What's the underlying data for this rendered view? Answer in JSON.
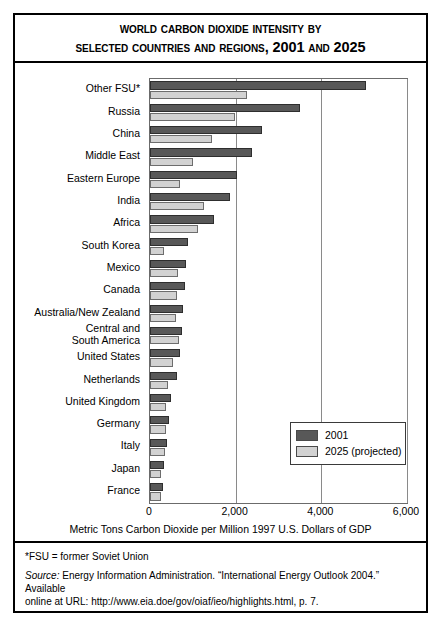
{
  "title": {
    "line1": "World Carbon Dioxide Intensity by",
    "line2": "Selected Countries and Regions, 2001 and 2025"
  },
  "legend": {
    "items": [
      {
        "label": "2001",
        "color": "#585858"
      },
      {
        "label": "2025 (projected)",
        "color": "#d2d2d2"
      }
    ]
  },
  "axis": {
    "xlabel": "Metric Tons Carbon Dioxide per Million 1997 U.S. Dollars of GDP",
    "ticks": [
      "0",
      "2,000",
      "4,000",
      "6,000"
    ]
  },
  "footnote": "*FSU = former Soviet Union",
  "source": {
    "label": "Source:",
    "line1": " Energy Information Administration. “International Energy Outlook 2004.” Available",
    "line2": "online at URL: http://www.eia.doe/gov/oiaf/ieo/highlights.html, p. 7."
  },
  "chart_data": {
    "type": "bar",
    "orientation": "horizontal",
    "title": "World Carbon Dioxide Intensity by Selected Countries and Regions, 2001 and 2025",
    "xlabel": "Metric Tons Carbon Dioxide per Million 1997 U.S. Dollars of GDP",
    "ylabel": "",
    "xlim": [
      0,
      6000
    ],
    "xticks": [
      0,
      2000,
      4000,
      6000
    ],
    "grid": true,
    "legend_position": "inside bottom-right",
    "categories": [
      "Other FSU*",
      "Russia",
      "China",
      "Middle East",
      "Eastern Europe",
      "India",
      "Africa",
      "South Korea",
      "Mexico",
      "Canada",
      "Australia/New Zealand",
      "Central and\nSouth America",
      "United States",
      "Netherlands",
      "United Kingdom",
      "Germany",
      "Italy",
      "Japan",
      "France"
    ],
    "series": [
      {
        "name": "2001",
        "color": "#585858",
        "values": [
          5050,
          3500,
          2620,
          2380,
          2030,
          1870,
          1490,
          890,
          840,
          810,
          780,
          740,
          700,
          640,
          480,
          450,
          400,
          330,
          310
        ]
      },
      {
        "name": "2025 (projected)",
        "color": "#d2d2d2",
        "values": [
          2270,
          1980,
          1450,
          1010,
          700,
          1260,
          1110,
          330,
          660,
          640,
          600,
          680,
          540,
          420,
          380,
          380,
          340,
          260,
          250
        ]
      }
    ]
  }
}
